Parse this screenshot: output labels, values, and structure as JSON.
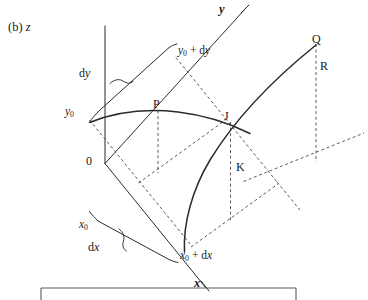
{
  "figure": {
    "panel_tag": "(b)",
    "type": "3d-surface-element-diagram",
    "background_color": "#ffffff",
    "ink_color": "#2b2b2b"
  },
  "axes": {
    "z": {
      "name": "z-axis",
      "label": "z"
    },
    "y": {
      "name": "y-axis",
      "label": "y"
    },
    "x": {
      "name": "x-axis",
      "label": "x"
    },
    "origin": {
      "label": "0"
    }
  },
  "coordinates": {
    "y_start": {
      "label": "y",
      "sub": "0"
    },
    "y_end": {
      "label": "y",
      "sub": "0",
      "tail": " + dy"
    },
    "x_start": {
      "label": "x",
      "sub": "0"
    },
    "x_end": {
      "label": "x",
      "sub": "0",
      "tail": " + dx"
    }
  },
  "differentials": {
    "dy": {
      "label": "dy",
      "lead": "d",
      "var": "y"
    },
    "dx": {
      "label": "dx",
      "lead": "d",
      "var": "x"
    }
  },
  "points": [
    {
      "id": "P",
      "label": "P"
    },
    {
      "id": "J",
      "label": "J"
    },
    {
      "id": "K",
      "label": "K"
    },
    {
      "id": "Q",
      "label": "Q"
    },
    {
      "id": "R",
      "label": "R"
    }
  ]
}
